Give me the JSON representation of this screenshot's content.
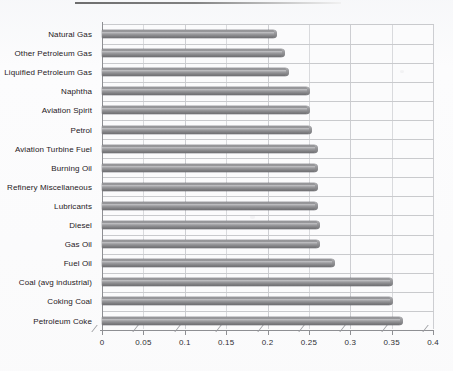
{
  "document": {
    "top_rule": "horizontal-rule"
  },
  "chart_data": {
    "type": "bar",
    "orientation": "horizontal",
    "title": "",
    "subtitle": "",
    "xlabel": "",
    "ylabel": "",
    "xlim": [
      0,
      0.4
    ],
    "ylim": null,
    "grid": true,
    "legend": null,
    "legend_position": "none",
    "style": "3d-cylinder-bar",
    "bar_color": "#8d8d90",
    "categories": [
      "Natural Gas",
      "Other Petroleum Gas",
      "Liquified Petroleum Gas",
      "Naphtha",
      "Aviation Spirit",
      "Petrol",
      "Aviation Turbine Fuel",
      "Burning Oil",
      "Refinery Miscellaneous",
      "Lubricants",
      "Diesel",
      "Gas Oil",
      "Fuel Oil",
      "Coal (avg industrial)",
      "Coking Coal",
      "Petroleum Coke"
    ],
    "values": [
      0.21,
      0.22,
      0.225,
      0.25,
      0.25,
      0.253,
      0.26,
      0.26,
      0.26,
      0.26,
      0.262,
      0.262,
      0.28,
      0.35,
      0.35,
      0.363
    ],
    "xticks": [
      0,
      0.05,
      0.1,
      0.15,
      0.2,
      0.25,
      0.3,
      0.35,
      0.4
    ],
    "xticklabels": [
      "0",
      "0.05",
      "0.1",
      "0.15",
      "0.2",
      "0.25",
      "0.3",
      "0.35",
      "0.4"
    ]
  }
}
